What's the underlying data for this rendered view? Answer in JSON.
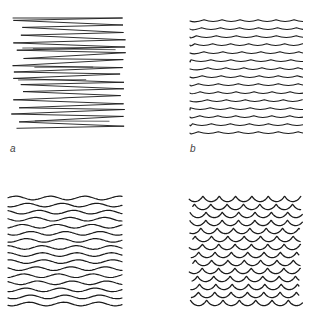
{
  "figure": {
    "panels": [
      {
        "id": "a",
        "label": "a",
        "style": "scribbled zigzag horizontal strokes",
        "line_count": 16
      },
      {
        "id": "b",
        "label": "b",
        "style": "gently wavy lines with small peaks",
        "line_count": 15
      },
      {
        "id": "c",
        "label": "",
        "style": "regular sine-like wavy lines",
        "line_count": 16
      },
      {
        "id": "d",
        "label": "",
        "style": "tight looping squiggle lines",
        "line_count": 14
      }
    ],
    "colors": {
      "ink": "#1a1a1a",
      "background": "#ffffff"
    }
  }
}
